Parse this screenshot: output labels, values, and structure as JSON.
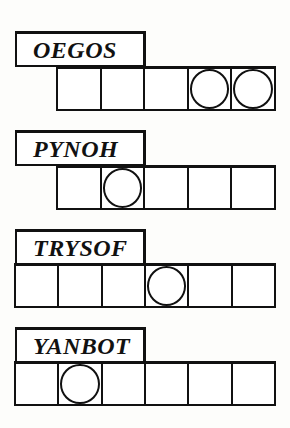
{
  "puzzles": [
    {
      "word": "OEGOS",
      "top": 31,
      "row_left": 58,
      "cells": 5,
      "circled": [
        3,
        4
      ]
    },
    {
      "word": "PYNOH",
      "top": 130,
      "row_left": 58,
      "cells": 5,
      "circled": [
        1
      ]
    },
    {
      "word": "TRYSOF",
      "top": 229,
      "row_left": 15,
      "cells": 6,
      "circled": [
        3
      ]
    },
    {
      "word": "YANBOT",
      "top": 327,
      "row_left": 15,
      "cells": 6,
      "circled": [
        1
      ]
    }
  ]
}
